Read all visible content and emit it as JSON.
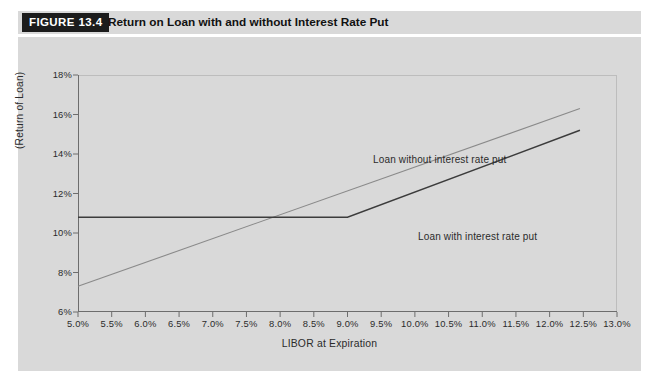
{
  "figure": {
    "tag": "FIGURE 13.4",
    "title": "Return on Loan with and without Interest Rate Put"
  },
  "chart_data": {
    "type": "line",
    "title": "Return on Loan with and without Interest Rate Put",
    "xlabel": "LIBOR at Expiration",
    "ylabel": "(Return of Loan)",
    "xlim": [
      5.0,
      13.0
    ],
    "ylim": [
      6.0,
      18.0
    ],
    "grid": false,
    "legend_position": "inline-annotation",
    "x_tick_labels": [
      "5.0%",
      "5.5%",
      "6.0%",
      "6.5%",
      "7.0%",
      "7.5%",
      "8.0%",
      "8.5%",
      "9.0%",
      "9.5%",
      "10.0%",
      "10.5%",
      "11.0%",
      "11.5%",
      "12.0%",
      "12.5%",
      "13.0%"
    ],
    "x_tick_values": [
      5.0,
      5.5,
      6.0,
      6.5,
      7.0,
      7.5,
      8.0,
      8.5,
      9.0,
      9.5,
      10.0,
      10.5,
      11.0,
      11.5,
      12.0,
      12.5,
      13.0
    ],
    "y_tick_labels": [
      "6%",
      "8%",
      "10%",
      "12%",
      "14%",
      "16%",
      "18%"
    ],
    "y_tick_values": [
      6,
      8,
      10,
      12,
      14,
      16,
      18
    ],
    "series": [
      {
        "name": "Loan without interest rate put",
        "color": "#8a8a8a",
        "x": [
          5.0,
          12.45
        ],
        "values": [
          7.3,
          16.3
        ],
        "annotation": "Loan without interest rate put"
      },
      {
        "name": "Loan with interest rate put",
        "color": "#3c3c3c",
        "x": [
          5.0,
          9.0,
          12.45
        ],
        "values": [
          10.8,
          10.8,
          15.2
        ],
        "annotation": "Loan with interest rate put"
      }
    ],
    "annotations": [
      {
        "text": "Loan without interest rate put",
        "x": 9.6,
        "y": 13.6
      },
      {
        "text": "Loan with interest rate put",
        "x": 10.3,
        "y": 10.2
      }
    ],
    "colors": {
      "panel_background": "#d9d9d9",
      "axis": "#6d6d6d",
      "text": "#2b2b2b",
      "series_without_put": "#8a8a8a",
      "series_with_put": "#3c3c3c",
      "tag_background": "#1c1c1c",
      "tag_text": "#ffffff"
    }
  }
}
